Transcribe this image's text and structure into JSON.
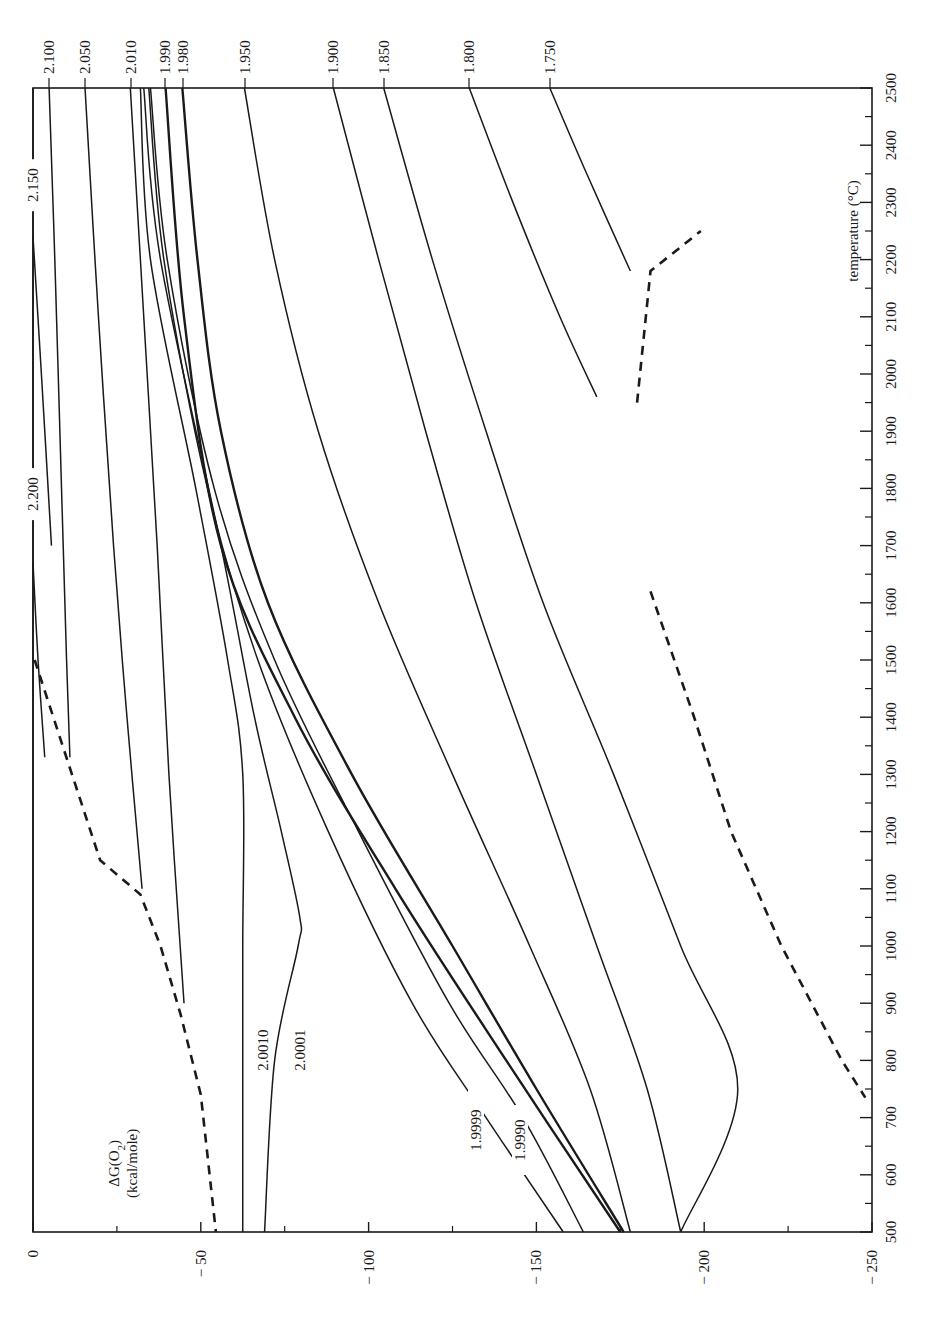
{
  "chart_data": {
    "type": "line",
    "orientation": "rotated 90° clockwise (temperature axis runs vertically on the right, ΔG axis runs horizontally along the bottom)",
    "title": "",
    "xlabel": "temperature (°C)",
    "ylabel": "ΔG(O₂) (kcal/mole)",
    "ylabel_line1": "ΔG(O",
    "ylabel_sub": "2",
    "ylabel_line1_end": ")",
    "ylabel_line2": "(kcal/mole)",
    "xlim": [
      500,
      2500
    ],
    "ylim": [
      -250,
      0
    ],
    "x_ticks": [
      500,
      600,
      700,
      800,
      900,
      1000,
      1100,
      1200,
      1300,
      1400,
      1500,
      1600,
      1700,
      1800,
      1900,
      2000,
      2100,
      2200,
      2300,
      2400,
      2500
    ],
    "y_ticks": [
      0,
      -50,
      -100,
      -150,
      -200,
      -250
    ],
    "y_tick_labels": [
      "0",
      "− 50",
      "− 100",
      "− 150",
      "− 200",
      "− 250"
    ],
    "grid": false,
    "legend": "none (curves labelled inline by O/M ratio)",
    "series": [
      {
        "name": "2.200",
        "style": "solid",
        "label_pos": "top-edge",
        "points": [
          [
            1670,
            0
          ],
          [
            1500,
            -1.5
          ],
          [
            1330,
            -3.5
          ]
        ]
      },
      {
        "name": "2.150",
        "style": "solid",
        "label_pos": "top-edge",
        "points": [
          [
            2240,
            0
          ],
          [
            2000,
            -2.5
          ],
          [
            1700,
            -5.5
          ]
        ]
      },
      {
        "name": "2.100",
        "style": "solid",
        "label_pos": "top",
        "points": [
          [
            2500,
            -4.8
          ],
          [
            2200,
            -6.5
          ],
          [
            1800,
            -8.5
          ],
          [
            1500,
            -10
          ],
          [
            1330,
            -11
          ]
        ]
      },
      {
        "name": "2.050",
        "style": "solid",
        "label_pos": "top",
        "points": [
          [
            2500,
            -15.5
          ],
          [
            2100,
            -19.5
          ],
          [
            1700,
            -24
          ],
          [
            1400,
            -28
          ],
          [
            1100,
            -32.5
          ]
        ]
      },
      {
        "name": "2.010",
        "style": "solid",
        "label_pos": "top",
        "points": [
          [
            2500,
            -29
          ],
          [
            2100,
            -33
          ],
          [
            1700,
            -37
          ],
          [
            1300,
            -40.5
          ],
          [
            900,
            -45
          ]
        ]
      },
      {
        "name": "2.0010",
        "style": "solid",
        "label_pos": "inline",
        "points": [
          [
            2500,
            -32
          ],
          [
            2200,
            -35
          ],
          [
            1800,
            -48.5
          ],
          [
            1500,
            -58
          ],
          [
            1300,
            -62.5
          ],
          [
            1000,
            -62.5
          ],
          [
            700,
            -62.5
          ],
          [
            500,
            -62.5
          ]
        ]
      },
      {
        "name": "2.0001",
        "style": "solid",
        "label_pos": "inline",
        "points": [
          [
            2500,
            -33
          ],
          [
            2200,
            -38
          ],
          [
            1700,
            -56
          ],
          [
            1400,
            -66
          ],
          [
            1200,
            -74
          ],
          [
            1050,
            -79.5
          ],
          [
            1000,
            -79
          ],
          [
            800,
            -72
          ],
          [
            500,
            -69
          ]
        ]
      },
      {
        "name": "1.9999",
        "style": "solid",
        "label_pos": "inline",
        "points": [
          [
            2500,
            -34.5
          ],
          [
            2200,
            -39
          ],
          [
            1800,
            -52
          ],
          [
            1500,
            -67
          ],
          [
            1200,
            -88
          ],
          [
            900,
            -113
          ],
          [
            700,
            -135
          ],
          [
            500,
            -158
          ]
        ]
      },
      {
        "name": "1.9990",
        "style": "solid",
        "label_pos": "inline",
        "points": [
          [
            2500,
            -35
          ],
          [
            2200,
            -40
          ],
          [
            1800,
            -54
          ],
          [
            1500,
            -72
          ],
          [
            1200,
            -97
          ],
          [
            900,
            -124
          ],
          [
            700,
            -146
          ],
          [
            500,
            -164
          ]
        ]
      },
      {
        "name": "1.990",
        "style": "solid-thick",
        "label_pos": "top",
        "points": [
          [
            2500,
            -39.5
          ],
          [
            2100,
            -45
          ],
          [
            1700,
            -56
          ],
          [
            1400,
            -78
          ],
          [
            1100,
            -108
          ],
          [
            800,
            -141
          ],
          [
            500,
            -175
          ]
        ]
      },
      {
        "name": "1.980",
        "style": "solid-thick",
        "label_pos": "top",
        "points": [
          [
            2500,
            -44.5
          ],
          [
            2200,
            -49
          ],
          [
            1900,
            -56
          ],
          [
            1600,
            -70
          ],
          [
            1300,
            -95
          ],
          [
            1000,
            -125
          ],
          [
            750,
            -150
          ],
          [
            500,
            -176
          ]
        ]
      },
      {
        "name": "1.950",
        "style": "solid",
        "label_pos": "top",
        "points": [
          [
            2500,
            -63
          ],
          [
            2200,
            -72
          ],
          [
            1900,
            -85
          ],
          [
            1600,
            -103
          ],
          [
            1300,
            -125
          ],
          [
            1000,
            -148
          ],
          [
            750,
            -166
          ],
          [
            500,
            -178
          ]
        ]
      },
      {
        "name": "1.900",
        "style": "solid",
        "label_pos": "top",
        "points": [
          [
            2500,
            -89.5
          ],
          [
            2200,
            -103
          ],
          [
            1900,
            -117
          ],
          [
            1600,
            -132
          ],
          [
            1300,
            -150
          ],
          [
            1000,
            -168
          ],
          [
            750,
            -183
          ],
          [
            500,
            -193
          ]
        ]
      },
      {
        "name": "1.850",
        "style": "solid",
        "label_pos": "top",
        "points": [
          [
            2500,
            -104.5
          ],
          [
            2200,
            -119
          ],
          [
            1900,
            -135
          ],
          [
            1600,
            -152
          ],
          [
            1300,
            -173
          ],
          [
            1000,
            -193
          ],
          [
            750,
            -210
          ],
          [
            500,
            -193
          ]
        ]
      },
      {
        "name": "1.800",
        "style": "solid",
        "label_pos": "top",
        "points": [
          [
            2500,
            -130
          ],
          [
            2300,
            -143
          ],
          [
            2100,
            -157
          ],
          [
            1960,
            -168
          ]
        ]
      },
      {
        "name": "1.750",
        "style": "solid",
        "label_pos": "top",
        "points": [
          [
            2500,
            -154
          ],
          [
            2350,
            -165
          ],
          [
            2180,
            -178
          ]
        ]
      },
      {
        "name": "phase-boundary",
        "style": "dashed",
        "label_pos": "none",
        "points": [
          [
            1500,
            -0.5
          ],
          [
            1320,
            -10.5
          ],
          [
            1150,
            -20
          ],
          [
            1090,
            -32
          ],
          [
            1000,
            -38
          ],
          [
            880,
            -44
          ],
          [
            740,
            -50
          ],
          [
            500,
            -54.5
          ],
          [
            1620,
            -184
          ],
          [
            1400,
            -197
          ],
          [
            1200,
            -208
          ],
          [
            1000,
            -223
          ],
          [
            800,
            -241
          ],
          [
            735,
            -248
          ],
          [
            1950,
            -180
          ],
          [
            2180,
            -184
          ],
          [
            2250,
            -199
          ]
        ]
      }
    ],
    "annotations": [
      "2.200",
      "2.150",
      "2.100",
      "2.050",
      "2.010",
      "1.990",
      "1.980",
      "1.950",
      "1.900",
      "1.850",
      "1.800",
      "1.750",
      "2.0010",
      "2.0001",
      "1.9999",
      "1.9990"
    ]
  }
}
